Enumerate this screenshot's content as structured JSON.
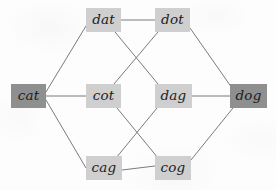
{
  "diagram": {
    "background_color": "#fdfdfd",
    "edge_color": "#7b7b80",
    "node_fill_normal": "#cfcfcf",
    "node_fill_highlight": "#8f8f8f",
    "label_color": "#1c1c1c",
    "nodes": [
      {
        "id": "cat",
        "label": "cat",
        "x": 11,
        "y": 84,
        "w": 35,
        "h": 24,
        "style": "highlight"
      },
      {
        "id": "dat",
        "label": "dat",
        "x": 86,
        "y": 8,
        "w": 35,
        "h": 24,
        "style": "normal"
      },
      {
        "id": "dot",
        "label": "dot",
        "x": 155,
        "y": 8,
        "w": 35,
        "h": 24,
        "style": "normal"
      },
      {
        "id": "cot",
        "label": "cot",
        "x": 86,
        "y": 84,
        "w": 35,
        "h": 24,
        "style": "normal"
      },
      {
        "id": "dag",
        "label": "dag",
        "x": 155,
        "y": 84,
        "w": 37,
        "h": 24,
        "style": "normal"
      },
      {
        "id": "cag",
        "label": "cag",
        "x": 86,
        "y": 156,
        "w": 36,
        "h": 24,
        "style": "normal"
      },
      {
        "id": "cog",
        "label": "cog",
        "x": 155,
        "y": 156,
        "w": 36,
        "h": 24,
        "style": "normal"
      },
      {
        "id": "dog",
        "label": "dog",
        "x": 230,
        "y": 84,
        "w": 37,
        "h": 24,
        "style": "highlight"
      }
    ],
    "edges": [
      {
        "from": "cat",
        "to": "dat",
        "x1": 46,
        "y1": 92,
        "x2": 86,
        "y2": 26
      },
      {
        "from": "cat",
        "to": "cot",
        "x1": 46,
        "y1": 96,
        "x2": 86,
        "y2": 96
      },
      {
        "from": "cat",
        "to": "cag",
        "x1": 46,
        "y1": 100,
        "x2": 86,
        "y2": 168
      },
      {
        "from": "dat",
        "to": "dot",
        "x1": 121,
        "y1": 20,
        "x2": 155,
        "y2": 20
      },
      {
        "from": "dat",
        "to": "dag",
        "x1": 115,
        "y1": 32,
        "x2": 158,
        "y2": 84
      },
      {
        "from": "dot",
        "to": "cot",
        "x1": 158,
        "y1": 32,
        "x2": 114,
        "y2": 84
      },
      {
        "from": "dot",
        "to": "dog",
        "x1": 190,
        "y1": 28,
        "x2": 232,
        "y2": 88
      },
      {
        "from": "cot",
        "to": "cog",
        "x1": 117,
        "y1": 108,
        "x2": 158,
        "y2": 158
      },
      {
        "from": "dag",
        "to": "cag",
        "x1": 157,
        "y1": 108,
        "x2": 116,
        "y2": 158
      },
      {
        "from": "dag",
        "to": "dog",
        "x1": 192,
        "y1": 96,
        "x2": 230,
        "y2": 96
      },
      {
        "from": "cag",
        "to": "cog",
        "x1": 122,
        "y1": 170,
        "x2": 155,
        "y2": 166
      },
      {
        "from": "cog",
        "to": "dog",
        "x1": 191,
        "y1": 160,
        "x2": 233,
        "y2": 108
      }
    ]
  }
}
